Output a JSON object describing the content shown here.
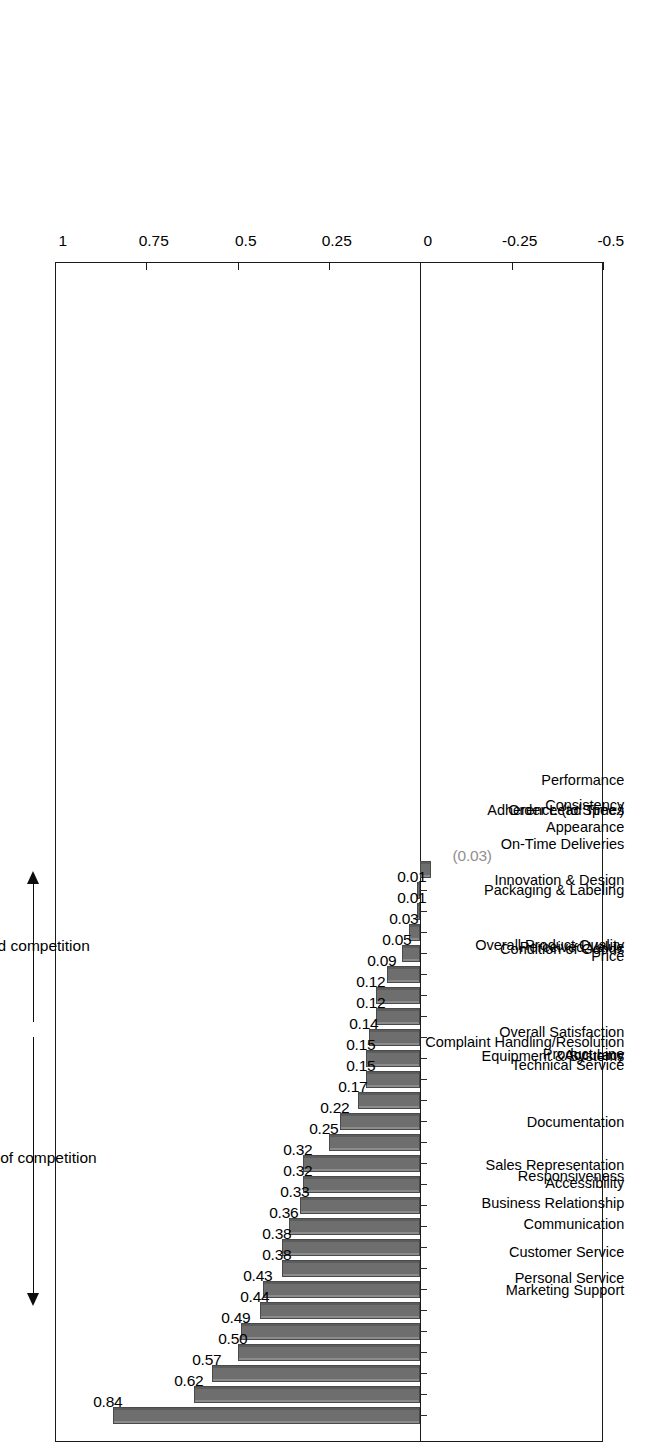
{
  "chart_data": {
    "type": "bar",
    "title": "",
    "subtitle": "",
    "xlabel": "",
    "ylabel": "",
    "orientation": "vertical-rotated-90ccw",
    "grid": false,
    "legend": null,
    "ylim": [
      -0.5,
      1
    ],
    "y_ticks": [
      "-0.5",
      "-0.25",
      "0",
      "0.25",
      "0.5",
      "0.75",
      "1"
    ],
    "y_tick_values": [
      -0.5,
      -0.25,
      0,
      0.25,
      0.5,
      0.75,
      1
    ],
    "categories": [
      "Marketing  Support",
      "Personal Service",
      "Customer Service",
      "Business Relationship",
      "Communication",
      "Sales Representation",
      "Responsiveness",
      "Accessibility",
      "Complaint Handling/Resolution",
      "Documentation",
      "Equipment & Systems",
      "Technical Service",
      "Overall Satisfaction",
      "Product Line",
      "Accuracy",
      "Overall Product Quality",
      "Condition of Goods",
      "Perceived Value",
      "Packaging & Labeling",
      "Innovation & Design",
      "Price",
      "On-Time Deliveries",
      "Adherence (to Spec.)",
      "Order Lead Times",
      "Appearance",
      "Consistency",
      "Performance"
    ],
    "values": [
      0.84,
      0.62,
      0.57,
      0.5,
      0.49,
      0.44,
      0.43,
      0.38,
      0.38,
      0.36,
      0.33,
      0.32,
      0.32,
      0.25,
      0.22,
      0.17,
      0.15,
      0.15,
      0.14,
      0.12,
      0.12,
      0.09,
      0.05,
      0.03,
      0.01,
      0.01,
      -0.03
    ],
    "data_labels": [
      "0.84",
      "0.62",
      "0.57",
      "0.50",
      "0.49",
      "0.44",
      "0.43",
      "0.38",
      "0.38",
      "0.36",
      "0.33",
      "0.32",
      "0.32",
      "0.25",
      "0.22",
      "0.17",
      "0.15",
      "0.15",
      "0.14",
      "0.12",
      "0.12",
      "0.09",
      "0.05",
      "0.03",
      "0.01",
      "0.01",
      "(0.03)"
    ],
    "annotations": [
      {
        "text": "ahead of competition",
        "direction": "up"
      },
      {
        "text": "behind competition",
        "direction": "down"
      }
    ],
    "colors": {
      "bar_fill": "#6e6e6e",
      "bar_edge": "#4a4a4a",
      "bar_highlight": "#8c8c8c",
      "axis": "#1a1a1a",
      "text": "#000000",
      "negative_label": "#8f8f8f",
      "background": "#ffffff"
    }
  }
}
